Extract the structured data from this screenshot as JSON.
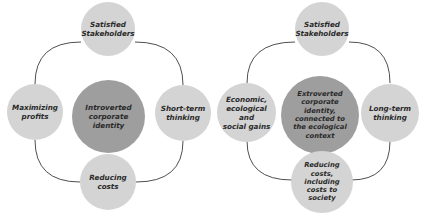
{
  "colors": {
    "outer_node": "#d4d4d4",
    "center_node": "#9e9e9e",
    "connector": "#3a3a3a",
    "text": "#2a2a2a"
  },
  "left_diagram": {
    "center": "Introverted\ncorporate\nidentity",
    "top": "Satisfied\nStakeholders",
    "left": "Maximizing\nprofits",
    "right": "Short-term\nthinking",
    "bottom": "Reducing\ncosts"
  },
  "right_diagram": {
    "center": "Extroverted\ncorporate\nidentity,\nconnected to\nthe ecological\ncontext",
    "top": "Satisfied\nStakeholders",
    "left": "Economic,\necological and\nsocial gains",
    "right": "Long-term\nthinking",
    "bottom": "Reducing\ncosts,\nincluding\ncosts to\nsociety"
  }
}
